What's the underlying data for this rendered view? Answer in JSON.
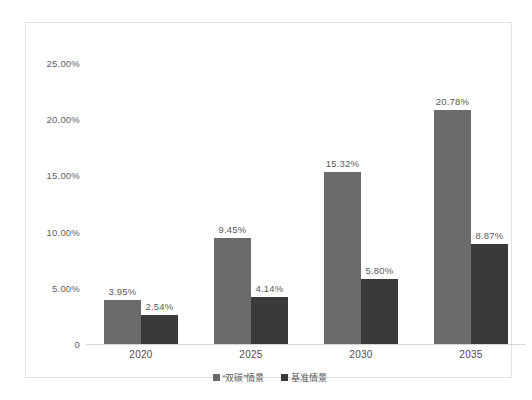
{
  "chart_data": {
    "type": "bar",
    "title": "",
    "subtitle": "",
    "xlabel": "",
    "ylabel": "",
    "categories": [
      "2020",
      "2025",
      "2030",
      "2035"
    ],
    "series": [
      {
        "name": "“双碳”情景",
        "color": "#6b6b6b",
        "values": [
          3.95,
          9.45,
          15.32,
          20.78
        ],
        "value_labels": [
          "3.95%",
          "9.45%",
          "15.32%",
          "20.78%"
        ]
      },
      {
        "name": "基准情景",
        "color": "#3a3a3a",
        "values": [
          2.54,
          4.14,
          5.8,
          8.87
        ],
        "value_labels": [
          "2.54%",
          "4.14%",
          "5.80%",
          "8.87%"
        ]
      }
    ],
    "ylim": [
      0,
      25
    ],
    "ytick_values": [
      25,
      20,
      15,
      10,
      5,
      0
    ],
    "ytick_labels": [
      "25.00%",
      "20.00%",
      "15.00%",
      "10.00%",
      "5.00%",
      "0"
    ],
    "grid": false,
    "legend_position": "bottom"
  },
  "colors": {
    "series_a": "#6b6b6b",
    "series_b": "#3a3a3a",
    "frame_border": "#e2e2e2",
    "axis_line": "#d6d6d6",
    "tick_text": "#606060",
    "label_text": "#5a5a5a",
    "background": "#ffffff"
  }
}
